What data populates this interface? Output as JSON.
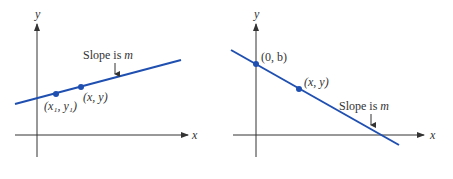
{
  "colors": {
    "axis": "#333333",
    "line": "#1f4fb0",
    "point": "#1f4fb0",
    "text": "#333333"
  },
  "left_graph": {
    "axis_x_label": "x",
    "axis_y_label": "y",
    "slope_label_prefix": "Slope is ",
    "slope_label_var": "m",
    "points": [
      {
        "label": "(x₁, y₁)"
      },
      {
        "label": "(x, y)"
      }
    ]
  },
  "right_graph": {
    "axis_x_label": "x",
    "axis_y_label": "y",
    "slope_label_prefix": "Slope is ",
    "slope_label_var": "m",
    "points": [
      {
        "label": "(0, b)"
      },
      {
        "label": "(x, y)"
      }
    ]
  }
}
